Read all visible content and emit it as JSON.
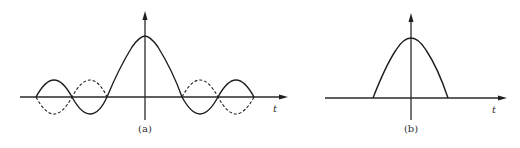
{
  "diagram": {
    "panels": [
      {
        "id": "a",
        "caption": "(a)",
        "axis_label": "t",
        "description": "sinc-like function (solid) with mirrored side lobes (dashed)",
        "solid_curve": "main lobe centered at origin with alternating side lobes",
        "dashed_curve": "negated side lobes"
      },
      {
        "id": "b",
        "caption": "(b)",
        "axis_label": "t",
        "description": "single positive lobe (truncated main lobe), zero elsewhere"
      }
    ],
    "colors": {
      "line": "#1e1e1e",
      "background": "#ffffff"
    }
  }
}
